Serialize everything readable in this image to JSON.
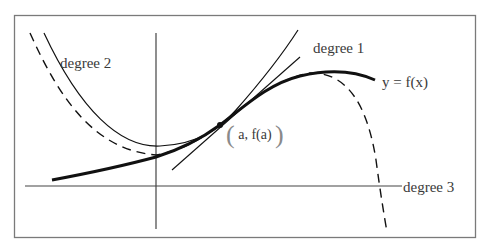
{
  "figure": {
    "labels": {
      "degree_2": "degree 2",
      "degree_1": "degree 1",
      "function": "y = f(x)",
      "degree_3": "degree 3",
      "point_open": "(",
      "point_text": "a, f(a)",
      "point_close": ")"
    },
    "colors": {
      "frame": "#7a7a7a",
      "axes": "#444444",
      "curve": "#111111",
      "text": "#3a3a3a",
      "background": "#ffffff"
    },
    "curves": [
      {
        "name": "function",
        "label": "y = f(x)",
        "style": "thick solid"
      },
      {
        "name": "degree 1",
        "label": "degree 1",
        "style": "thin solid tangent line"
      },
      {
        "name": "degree 2",
        "label": "degree 2",
        "style": "thin solid parabola"
      },
      {
        "name": "degree 3",
        "label": "degree 3",
        "style": "dashed cubic"
      }
    ],
    "point_of_tangency": "(a, f(a))"
  }
}
